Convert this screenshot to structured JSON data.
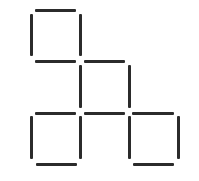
{
  "diagram": {
    "type": "matchstick-puzzle",
    "stick_color": "#2b2b2b",
    "background": "#ffffff",
    "squares": [
      {
        "name": "top-square",
        "x": 32,
        "y": 10,
        "size": 50
      },
      {
        "name": "middle-square",
        "x": 80,
        "y": 61,
        "size": 50
      },
      {
        "name": "bottom-left-square",
        "x": 32,
        "y": 113,
        "size": 50
      },
      {
        "name": "bottom-right-square",
        "x": 128,
        "y": 113,
        "size": 50
      }
    ],
    "sticks": [
      {
        "id": "top-square-top",
        "o": "h",
        "x": 35,
        "y": 9,
        "len": 41
      },
      {
        "id": "top-square-left",
        "o": "v",
        "x": 30,
        "y": 14,
        "len": 42
      },
      {
        "id": "top-square-right",
        "o": "v",
        "x": 79,
        "y": 14,
        "len": 42
      },
      {
        "id": "top-square-bottom",
        "o": "h",
        "x": 35,
        "y": 60,
        "len": 41
      },
      {
        "id": "middle-square-top",
        "o": "h",
        "x": 84,
        "y": 60,
        "len": 41
      },
      {
        "id": "middle-square-left",
        "o": "v",
        "x": 79,
        "y": 65,
        "len": 43
      },
      {
        "id": "middle-square-right",
        "o": "v",
        "x": 128,
        "y": 65,
        "len": 43
      },
      {
        "id": "middle-square-bottom",
        "o": "h",
        "x": 84,
        "y": 112,
        "len": 41
      },
      {
        "id": "bottom-left-square-top",
        "o": "h",
        "x": 35,
        "y": 112,
        "len": 41
      },
      {
        "id": "bottom-left-square-left",
        "o": "v",
        "x": 30,
        "y": 116,
        "len": 43
      },
      {
        "id": "bottom-left-square-right",
        "o": "v",
        "x": 79,
        "y": 116,
        "len": 43
      },
      {
        "id": "bottom-left-square-bottom",
        "o": "h",
        "x": 36,
        "y": 163,
        "len": 41
      },
      {
        "id": "bottom-right-square-top",
        "o": "h",
        "x": 132,
        "y": 112,
        "len": 42
      },
      {
        "id": "bottom-right-square-left",
        "o": "v",
        "x": 128,
        "y": 116,
        "len": 43
      },
      {
        "id": "bottom-right-square-right",
        "o": "v",
        "x": 177,
        "y": 116,
        "len": 43
      },
      {
        "id": "bottom-right-square-bottom",
        "o": "h",
        "x": 133,
        "y": 163,
        "len": 41
      }
    ]
  }
}
